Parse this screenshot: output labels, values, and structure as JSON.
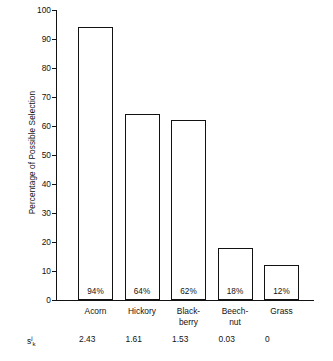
{
  "chart_data": {
    "type": "bar",
    "title": "",
    "xlabel": "",
    "ylabel": "Percentage of Possible Selection",
    "ylim": [
      0,
      100
    ],
    "grid": false,
    "legend": "none",
    "categories": [
      "Acorn",
      "Hickory",
      "Black-berry",
      "Beech-nut",
      "Grass"
    ],
    "category_lines": [
      [
        "Acorn"
      ],
      [
        "Hickory"
      ],
      [
        "Black-",
        "berry"
      ],
      [
        "Beech-",
        "nut"
      ],
      [
        "Grass"
      ]
    ],
    "values": [
      94,
      64,
      62,
      18,
      12
    ],
    "value_labels": [
      "94%",
      "64%",
      "62%",
      "18%",
      "12%"
    ],
    "y_ticks": [
      0,
      10,
      20,
      30,
      40,
      50,
      60,
      70,
      80,
      90,
      100
    ],
    "y_tick_labels": [
      "0",
      "10",
      "20",
      "30",
      "40",
      "50",
      "60",
      "70",
      "80",
      "90",
      "100"
    ],
    "secondary_row": {
      "symbol_base": "s",
      "symbol_superscript": "j",
      "symbol_subscript": "k",
      "values": [
        "2.43",
        "1.61",
        "1.53",
        "0.03",
        "0"
      ]
    },
    "bar_style": {
      "fill": "#ffffff",
      "edge": "#121212"
    }
  },
  "bottom_caption": ""
}
